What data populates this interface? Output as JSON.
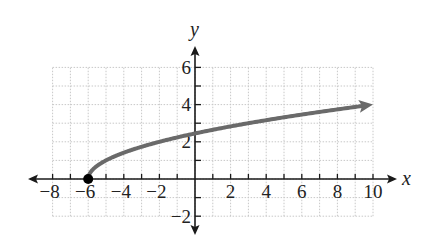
{
  "chart_data": {
    "type": "line",
    "title": "",
    "function": "y = sqrt(x + 6)",
    "xlabel": "x",
    "ylabel": "y",
    "xlim": [
      -8,
      10
    ],
    "ylim": [
      -2,
      6
    ],
    "grid": true,
    "x_ticks": [
      -8,
      -6,
      -4,
      -2,
      2,
      4,
      6,
      8,
      10
    ],
    "y_ticks": [
      -2,
      2,
      4,
      6
    ],
    "x_tick_labels": [
      "−8",
      "−6",
      "−4",
      "−2",
      "2",
      "4",
      "6",
      "8",
      "10"
    ],
    "y_tick_labels": [
      "−2",
      "2",
      "4",
      "6"
    ],
    "series": [
      {
        "name": "sqrt(x+6)",
        "color": "#6a6a6a",
        "x": [
          -6,
          -5,
          -4,
          -3,
          -2,
          -1,
          0,
          1,
          2,
          3,
          4,
          5,
          6,
          7,
          8,
          9,
          10
        ],
        "y": [
          0,
          1,
          1.414,
          1.732,
          2,
          2.236,
          2.449,
          2.646,
          2.828,
          3,
          3.162,
          3.317,
          3.464,
          3.606,
          3.742,
          3.873,
          4
        ],
        "start_point": {
          "x": -6,
          "y": 0,
          "marker": "filled-circle"
        },
        "end_arrow": true
      }
    ]
  },
  "colors": {
    "axis": "#1a1a1a",
    "curve": "#6a6a6a",
    "grid": "#c8c8c8",
    "point": "#000000"
  }
}
